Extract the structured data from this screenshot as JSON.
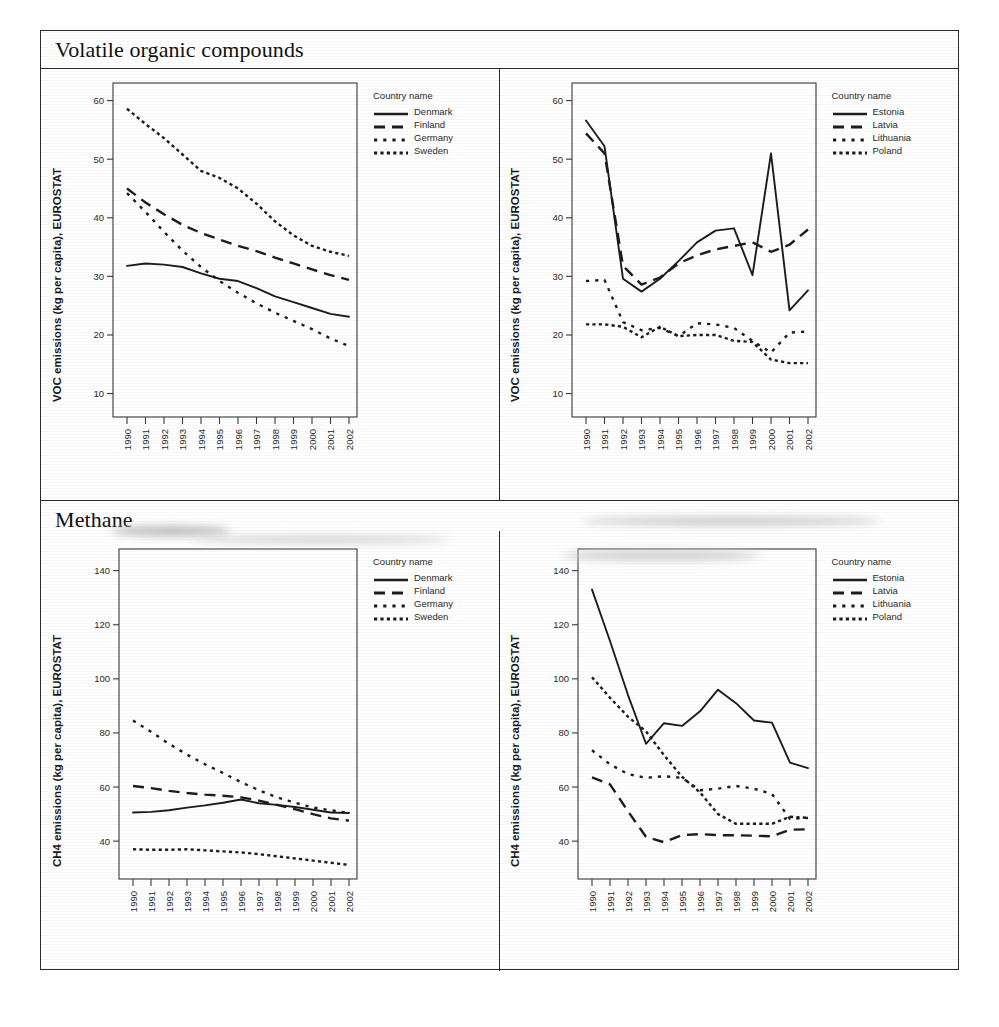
{
  "figure": {
    "years": [
      "1990",
      "1991",
      "1992",
      "1993",
      "1994",
      "1995",
      "1996",
      "1997",
      "1998",
      "1999",
      "2000",
      "2001",
      "2002"
    ],
    "legend_title": "Country name",
    "sections": [
      {
        "title": "Volatile organic compounds"
      },
      {
        "title": "Methane"
      }
    ]
  },
  "chart_data": [
    {
      "type": "line",
      "panel": "top-left",
      "title": "Volatile organic compounds",
      "xlabel": "",
      "ylabel": "VOC emissions (kg per capita), EUROSTAT",
      "x": [
        "1990",
        "1991",
        "1992",
        "1993",
        "1994",
        "1995",
        "1996",
        "1997",
        "1998",
        "1999",
        "2000",
        "2001",
        "2002"
      ],
      "ylim": [
        6,
        63
      ],
      "yticks": [
        10,
        20,
        30,
        40,
        50,
        60
      ],
      "grid": false,
      "legend_position": "right",
      "legend_title": "Country name",
      "series": [
        {
          "name": "Denmark",
          "style": "solid",
          "values": [
            31.8,
            32.2,
            32.0,
            31.6,
            30.5,
            29.6,
            29.2,
            28.0,
            26.6,
            25.6,
            24.6,
            23.6,
            23.1
          ]
        },
        {
          "name": "Finland",
          "style": "dashed",
          "values": [
            45.0,
            42.6,
            40.6,
            38.8,
            37.4,
            36.3,
            35.2,
            34.3,
            33.2,
            32.2,
            31.2,
            30.2,
            29.4
          ]
        },
        {
          "name": "Germany",
          "style": "dotted",
          "values": [
            44.2,
            41.0,
            37.6,
            34.4,
            31.6,
            29.2,
            27.2,
            25.4,
            23.8,
            22.4,
            21.0,
            19.4,
            18.1
          ]
        },
        {
          "name": "Sweden",
          "style": "fine-dotted",
          "values": [
            58.6,
            56.0,
            53.6,
            50.8,
            48.0,
            46.8,
            45.0,
            42.4,
            39.4,
            37.0,
            35.2,
            34.2,
            33.5
          ]
        }
      ]
    },
    {
      "type": "line",
      "panel": "top-right",
      "title": "Volatile organic compounds",
      "xlabel": "",
      "ylabel": "VOC emissions (kg per capita), EUROSTAT",
      "x": [
        "1990",
        "1991",
        "1992",
        "1993",
        "1994",
        "1995",
        "1996",
        "1997",
        "1998",
        "1999",
        "2000",
        "2001",
        "2002"
      ],
      "ylim": [
        6,
        63
      ],
      "yticks": [
        10,
        20,
        30,
        40,
        50,
        60
      ],
      "grid": false,
      "legend_position": "right",
      "legend_title": "Country name",
      "series": [
        {
          "name": "Estonia",
          "style": "solid",
          "values": [
            56.6,
            52.2,
            29.6,
            27.4,
            29.6,
            32.6,
            35.8,
            37.8,
            38.2,
            30.2,
            51.0,
            24.2,
            27.6
          ]
        },
        {
          "name": "Latvia",
          "style": "dashed",
          "values": [
            54.4,
            51.0,
            31.8,
            28.6,
            29.8,
            32.2,
            33.6,
            34.6,
            35.2,
            35.8,
            34.2,
            35.4,
            38.0
          ]
        },
        {
          "name": "Lithuania",
          "style": "dotted",
          "values": [
            29.2,
            29.4,
            22.2,
            20.8,
            21.2,
            19.8,
            22.0,
            21.8,
            21.2,
            19.0,
            17.0,
            20.4,
            20.6
          ]
        },
        {
          "name": "Poland",
          "style": "fine-dotted",
          "values": [
            21.8,
            21.8,
            21.4,
            19.6,
            21.4,
            19.8,
            20.0,
            20.0,
            19.0,
            18.8,
            15.8,
            15.2,
            15.2
          ]
        }
      ]
    },
    {
      "type": "line",
      "panel": "bottom-left",
      "title": "Methane",
      "xlabel": "",
      "ylabel": "CH4 emissions (kg per capita), EUROSTAT",
      "x": [
        "1990",
        "1991",
        "1992",
        "1993",
        "1994",
        "1995",
        "1996",
        "1997",
        "1998",
        "1999",
        "2000",
        "2001",
        "2002"
      ],
      "ylim": [
        26,
        148
      ],
      "yticks": [
        40,
        60,
        80,
        100,
        120,
        140
      ],
      "grid": false,
      "legend_position": "right",
      "legend_title": "Country name",
      "series": [
        {
          "name": "Denmark",
          "style": "solid",
          "values": [
            50.6,
            50.8,
            51.4,
            52.4,
            53.2,
            54.2,
            55.4,
            54.0,
            53.4,
            52.6,
            51.6,
            50.6,
            50.4
          ]
        },
        {
          "name": "Finland",
          "style": "dashed",
          "values": [
            60.4,
            59.6,
            58.6,
            57.8,
            57.2,
            56.8,
            56.2,
            55.0,
            53.4,
            51.8,
            50.0,
            48.4,
            47.6
          ]
        },
        {
          "name": "Germany",
          "style": "dotted",
          "values": [
            84.6,
            80.4,
            76.0,
            72.0,
            68.4,
            65.2,
            61.8,
            58.8,
            56.2,
            54.2,
            52.4,
            51.4,
            50.4
          ]
        },
        {
          "name": "Sweden",
          "style": "fine-dotted",
          "values": [
            37.0,
            36.8,
            36.8,
            37.0,
            36.6,
            36.2,
            35.8,
            35.2,
            34.4,
            33.6,
            32.8,
            32.0,
            31.2
          ]
        }
      ]
    },
    {
      "type": "line",
      "panel": "bottom-right",
      "title": "Methane",
      "xlabel": "",
      "ylabel": "CH4 emissions (kg per capita), EUROSTAT",
      "x": [
        "1990",
        "1991",
        "1992",
        "1993",
        "1994",
        "1995",
        "1996",
        "1997",
        "1998",
        "1999",
        "2000",
        "2001",
        "2002"
      ],
      "ylim": [
        26,
        148
      ],
      "yticks": [
        40,
        60,
        80,
        100,
        120,
        140
      ],
      "grid": false,
      "legend_position": "right",
      "legend_title": "Country name",
      "series": [
        {
          "name": "Estonia",
          "style": "solid",
          "values": [
            133.0,
            114.0,
            94.0,
            76.0,
            83.6,
            82.6,
            88.0,
            96.0,
            91.0,
            84.6,
            83.8,
            69.0,
            67.0
          ]
        },
        {
          "name": "Latvia",
          "style": "dashed",
          "values": [
            63.6,
            61.0,
            51.0,
            41.6,
            39.6,
            42.2,
            42.6,
            42.2,
            42.2,
            42.0,
            41.8,
            44.2,
            44.4
          ]
        },
        {
          "name": "Lithuania",
          "style": "dotted",
          "values": [
            73.6,
            68.4,
            64.8,
            63.4,
            64.0,
            63.4,
            58.8,
            59.4,
            60.4,
            59.4,
            57.4,
            48.2,
            48.6
          ]
        },
        {
          "name": "Poland",
          "style": "fine-dotted",
          "values": [
            100.6,
            93.0,
            86.0,
            80.6,
            71.8,
            63.8,
            58.0,
            50.0,
            46.4,
            46.4,
            46.4,
            49.0,
            48.6
          ]
        }
      ]
    }
  ]
}
